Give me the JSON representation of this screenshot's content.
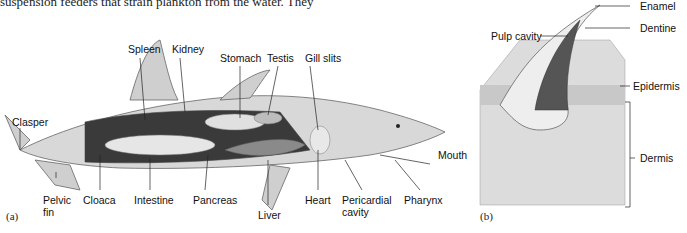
{
  "top_text": "suspension feeders that strain plankton from the water. They",
  "figure_a": {
    "panel_label": "(a)",
    "labels": {
      "spleen": "Spleen",
      "kidney": "Kidney",
      "stomach": "Stomach",
      "testis": "Testis",
      "gill_slits": "Gill slits",
      "clasper": "Clasper",
      "mouth": "Mouth",
      "pelvic_fin": "Pelvic\nfin",
      "cloaca": "Cloaca",
      "intestine": "Intestine",
      "pancreas": "Pancreas",
      "liver": "Liver",
      "heart": "Heart",
      "pericardial_cavity": "Pericardial\ncavity",
      "pharynx": "Pharynx"
    }
  },
  "figure_b": {
    "panel_label": "(b)",
    "labels": {
      "enamel": "Enamel",
      "pulp_cavity": "Pulp cavity",
      "dentine": "Dentine",
      "epidermis": "Epidermis",
      "dermis": "Dermis"
    }
  }
}
